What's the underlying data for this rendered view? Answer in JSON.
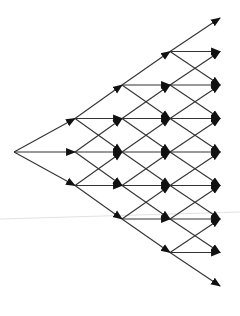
{
  "diagram": {
    "type": "trinomial-lattice",
    "colors": {
      "edge": "#333333",
      "background": "#ffffff",
      "scanline": "#e2e2e2"
    },
    "layout": {
      "columns_x": [
        14,
        75,
        122,
        170,
        220
      ],
      "center_y": 152,
      "row_step": 33.5
    },
    "steps": 4,
    "nodes_per_column": [
      1,
      3,
      5,
      7,
      9
    ],
    "branches_per_node": [
      "up",
      "middle",
      "down"
    ]
  }
}
